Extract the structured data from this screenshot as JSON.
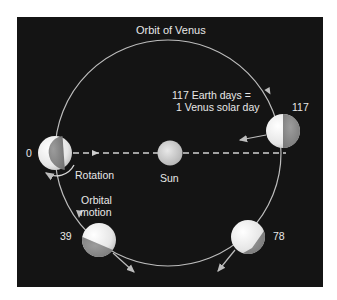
{
  "title": "Orbit of Venus",
  "annotation": {
    "line1": "117 Earth days =",
    "line2": "1 Venus solar day"
  },
  "sun_label": "Sun",
  "rotation_label": "Rotation",
  "orbital_motion": {
    "line1": "Orbital",
    "line2": "motion"
  },
  "positions": [
    {
      "label": "0"
    },
    {
      "label": "39"
    },
    {
      "label": "78"
    },
    {
      "label": "117"
    }
  ],
  "colors": {
    "background": "#141414",
    "orbit": "#bdbdbd",
    "text": "#e8e8e8",
    "planet_light": "#f2f2f2",
    "planet_dark": "#8a8a8a"
  }
}
